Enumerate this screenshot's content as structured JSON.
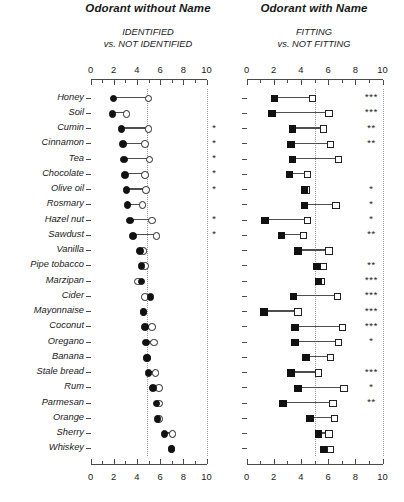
{
  "panels": [
    {
      "id": "without-name",
      "title": "Odorant without Name",
      "subtitle_line1": "IDENTIFIED",
      "subtitle_line2": "vs. NOT IDENTIFIED",
      "axis_ticks": [
        "0",
        "2",
        "4",
        "6",
        "8",
        "10"
      ],
      "marker_shape": "circle",
      "reference_value": 4.9
    },
    {
      "id": "with-name",
      "title": "Odorant with Name",
      "subtitle_line1": "FITTING",
      "subtitle_line2": "vs. NOT FITTING",
      "axis_ticks": [
        "0",
        "2",
        "4",
        "6",
        "8",
        "10"
      ],
      "marker_shape": "square",
      "reference_value": 5.0
    }
  ],
  "chart_data": {
    "type": "scatter",
    "xlabel": "",
    "ylabel": "",
    "xlim": [
      0,
      10
    ],
    "grid": false,
    "legend": "none",
    "categories": [
      "Honey",
      "Soil",
      "Cumin",
      "Cinnamon",
      "Tea",
      "Chocolate",
      "Olive oil",
      "Rosmary",
      "Hazel nut",
      "Sawdust",
      "Vanilla",
      "Pipe tobacco",
      "Marzipan",
      "Cider",
      "Mayonnaise",
      "Coconut",
      "Oregano",
      "Banana",
      "Stale bread",
      "Rum",
      "Parmesan",
      "Orange",
      "Sherry",
      "Whiskey"
    ],
    "series": [
      {
        "name": "Odorant without Name - filled (identified)",
        "panel": "without-name",
        "marker": "filled-circle",
        "values": [
          1.9,
          1.8,
          2.6,
          2.7,
          2.8,
          2.9,
          3.0,
          3.1,
          3.3,
          3.6,
          4.2,
          4.3,
          4.3,
          5.1,
          4.5,
          4.6,
          4.7,
          4.8,
          4.9,
          5.3,
          5.6,
          5.7,
          6.3,
          6.9
        ]
      },
      {
        "name": "Odorant without Name - open (not identified)",
        "panel": "without-name",
        "marker": "open-circle",
        "values": [
          4.9,
          3.0,
          4.9,
          4.6,
          5.0,
          4.6,
          4.7,
          4.4,
          5.2,
          5.6,
          4.5,
          4.6,
          4.0,
          4.6,
          4.5,
          5.2,
          5.4,
          4.8,
          5.5,
          5.8,
          5.8,
          5.8,
          7.0,
          6.9
        ]
      },
      {
        "name": "Odorant with Name - filled (fitting)",
        "panel": "with-name",
        "marker": "filled-square",
        "values": [
          2.0,
          1.8,
          3.3,
          3.2,
          3.3,
          3.1,
          4.2,
          4.2,
          1.3,
          2.5,
          3.7,
          5.1,
          5.2,
          3.4,
          1.2,
          3.5,
          3.5,
          4.3,
          3.2,
          3.7,
          2.6,
          4.6,
          5.2,
          5.6
        ]
      },
      {
        "name": "Odorant with Name - open (not fitting)",
        "panel": "with-name",
        "marker": "open-square",
        "values": [
          4.8,
          6.0,
          5.6,
          6.1,
          6.7,
          4.4,
          4.3,
          6.5,
          4.4,
          4.1,
          6.0,
          5.6,
          5.4,
          6.6,
          3.7,
          7.0,
          6.7,
          6.1,
          5.2,
          7.1,
          6.3,
          6.4,
          6.0,
          6.1
        ]
      }
    ],
    "significance_without_name": [
      "",
      "",
      "*",
      "*",
      "*",
      "*",
      "*",
      "",
      "*",
      "*",
      "",
      "",
      "",
      "",
      "",
      "",
      "",
      "",
      "",
      "",
      "",
      "",
      "",
      ""
    ],
    "significance_with_name": [
      "***",
      "***",
      "**",
      "**",
      "",
      "",
      "*",
      "*",
      "*",
      "**",
      "",
      "**",
      "***",
      "***",
      "***",
      "***",
      "*",
      "",
      "***",
      "*",
      "**",
      "",
      "",
      ""
    ]
  }
}
